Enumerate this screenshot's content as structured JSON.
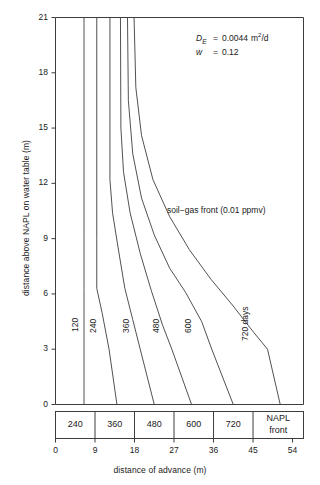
{
  "chart_data": {
    "type": "line",
    "title": "",
    "xlabel": "distance of advance (m)",
    "ylabel": "distance above NAPL on water table (m)",
    "xlim": [
      0,
      56.5
    ],
    "ylim": [
      0,
      21
    ],
    "xticks": [
      0,
      9,
      18,
      27,
      36,
      45,
      54
    ],
    "yticks": [
      0,
      3,
      6,
      9,
      12,
      15,
      18,
      21
    ],
    "grid": false,
    "legend": "inline-curve-labels",
    "annotations": [
      {
        "name": "diffusion-coefficient",
        "symbol": "D",
        "subscript": "E",
        "equals": "=",
        "value": "0.0044",
        "units": "m2/d"
      },
      {
        "name": "moisture-content",
        "symbol": "w",
        "equals": "=",
        "value": "0.12",
        "units": ""
      },
      {
        "name": "soil-gas-front",
        "text": "soil−gas front (0.01 ppmv)"
      }
    ],
    "series": [
      {
        "name": "120",
        "label": "120",
        "label_suffix": "",
        "points": [
          [
            6.5,
            21
          ],
          [
            6.5,
            9.0
          ],
          [
            6.5,
            6.3
          ],
          [
            6.5,
            3.0
          ],
          [
            6.5,
            0
          ]
        ]
      },
      {
        "name": "240",
        "label": "240",
        "label_suffix": "",
        "points": [
          [
            9.4,
            21
          ],
          [
            9.4,
            9.0
          ],
          [
            9.4,
            6.3
          ],
          [
            10.6,
            5.0
          ],
          [
            12.2,
            3.0
          ],
          [
            14.0,
            0
          ]
        ]
      },
      {
        "name": "360",
        "label": "360",
        "label_suffix": "",
        "points": [
          [
            12.4,
            21
          ],
          [
            12.4,
            12.2
          ],
          [
            13.0,
            10.4
          ],
          [
            14.2,
            8.6
          ],
          [
            15.8,
            6.3
          ],
          [
            17.6,
            4.6
          ],
          [
            19.3,
            3.0
          ],
          [
            22.5,
            0
          ]
        ]
      },
      {
        "name": "480",
        "label": "480",
        "label_suffix": "",
        "points": [
          [
            14.8,
            21
          ],
          [
            14.9,
            15.0
          ],
          [
            15.5,
            12.6
          ],
          [
            17.0,
            10.4
          ],
          [
            19.3,
            8.2
          ],
          [
            21.8,
            6.2
          ],
          [
            24.4,
            4.3
          ],
          [
            26.5,
            3.0
          ],
          [
            31.0,
            0
          ]
        ]
      },
      {
        "name": "600",
        "label": "600",
        "label_suffix": "",
        "points": [
          [
            16.4,
            21
          ],
          [
            16.6,
            16.5
          ],
          [
            17.6,
            13.6
          ],
          [
            19.6,
            11.2
          ],
          [
            22.5,
            9.2
          ],
          [
            26.0,
            7.4
          ],
          [
            29.6,
            6.1
          ],
          [
            33.3,
            4.5
          ],
          [
            35.6,
            3.0
          ],
          [
            40.5,
            0
          ]
        ]
      },
      {
        "name": "720",
        "label": "720",
        "label_suffix": " days",
        "points": [
          [
            17.9,
            21
          ],
          [
            18.3,
            17.2
          ],
          [
            19.6,
            14.6
          ],
          [
            22.2,
            12.2
          ],
          [
            26.0,
            10.2
          ],
          [
            30.5,
            8.4
          ],
          [
            35.4,
            6.8
          ],
          [
            40.3,
            5.4
          ],
          [
            45.2,
            3.9
          ],
          [
            48.3,
            3.0
          ],
          [
            51.2,
            0
          ]
        ]
      }
    ],
    "curve_labels": [
      {
        "text": "120",
        "x": 6.5,
        "y": 4.5,
        "rotation": -90
      },
      {
        "text": "240",
        "x": 10.5,
        "y": 4.4,
        "rotation": -90
      },
      {
        "text": "360",
        "x": 18.0,
        "y": 4.4,
        "rotation": -90
      },
      {
        "text": "480",
        "x": 24.9,
        "y": 4.4,
        "rotation": -90
      },
      {
        "text": "600",
        "x": 32.3,
        "y": 4.4,
        "rotation": -90
      },
      {
        "text": "720 days",
        "x": 45.2,
        "y": 4.0,
        "rotation": -90
      }
    ],
    "front_table": {
      "name": "napl-front-table",
      "cells": [
        {
          "label": "240",
          "x_start": 0,
          "x_end": 9
        },
        {
          "label": "360",
          "x_start": 9,
          "x_end": 18
        },
        {
          "label": "480",
          "x_start": 18,
          "x_end": 27
        },
        {
          "label": "600",
          "x_start": 27,
          "x_end": 36
        },
        {
          "label": "720",
          "x_start": 36,
          "x_end": 45
        },
        {
          "label": "NAPL\nfront",
          "label_line1": "NAPL",
          "label_line2": "front",
          "x_start": 45,
          "x_end": 56.5
        }
      ]
    },
    "colors": {
      "line": "#3d3d3d",
      "axis": "#3d3d3d",
      "text": "#1a1a1a",
      "background": "#ffffff"
    }
  },
  "annotation_text": {
    "d_symbol": "D",
    "d_subscript": "E",
    "d_equals": "=",
    "d_value": "0.0044",
    "d_unit_base": "m",
    "d_unit_sup": "2",
    "d_unit_tail": "/d",
    "w_symbol": "w",
    "w_equals": "=",
    "w_value": "0.12",
    "soil_gas_front": "soil−gas front (0.01 ppmv)"
  },
  "axes": {
    "x_title": "distance of advance (m)",
    "y_title": "distance above NAPL on water table (m)",
    "x_tick_labels": [
      "0",
      "9",
      "18",
      "27",
      "36",
      "45",
      "54"
    ],
    "y_tick_labels": [
      "0",
      "3",
      "6",
      "9",
      "12",
      "15",
      "18",
      "21"
    ]
  },
  "table_labels": {
    "c1": "240",
    "c2": "360",
    "c3": "480",
    "c4": "600",
    "c5": "720",
    "c6_line1": "NAPL",
    "c6_line2": "front"
  },
  "curve_labels": {
    "l1": "120",
    "l2": "240",
    "l3": "360",
    "l4": "480",
    "l5": "600",
    "l6": "720 days"
  }
}
